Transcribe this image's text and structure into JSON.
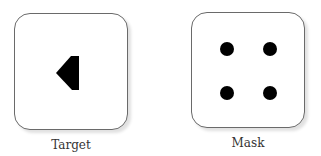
{
  "panels": {
    "target": {
      "caption": "Target",
      "shape": "left-pointing-pentagon",
      "fill": "#000000"
    },
    "mask": {
      "caption": "Mask",
      "dots": 4,
      "dot_layout": "2x2 grid",
      "fill": "#000000"
    }
  }
}
